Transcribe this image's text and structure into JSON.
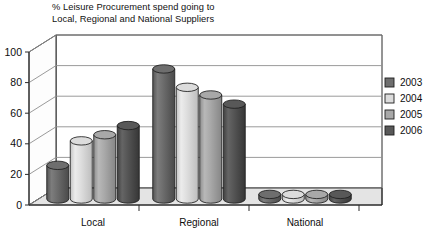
{
  "chart_data": {
    "type": "bar",
    "title": "% Leisure Procurement spend going to\nLocal, Regional and National Suppliers",
    "xlabel": "",
    "ylabel": "",
    "ylim": [
      0,
      100
    ],
    "yticks": [
      0,
      20,
      40,
      60,
      80,
      100
    ],
    "grid": true,
    "legend_position": "right",
    "style": "3d-cylinder",
    "categories": [
      "Local",
      "Regional",
      "National"
    ],
    "series": [
      {
        "name": "2003",
        "color": "#6e6e6e",
        "values": [
          22,
          85,
          3
        ]
      },
      {
        "name": "2004",
        "color": "#dcdcdc",
        "values": [
          38,
          73,
          3
        ]
      },
      {
        "name": "2005",
        "color": "#a8a8a8",
        "values": [
          42,
          68,
          3
        ]
      },
      {
        "name": "2006",
        "color": "#585858",
        "values": [
          48,
          62,
          3
        ]
      }
    ]
  },
  "axis": {
    "tick_labels": [
      "0",
      "20",
      "40",
      "60",
      "80",
      "100"
    ]
  },
  "categories": {
    "labels": [
      "Local",
      "Regional",
      "National"
    ]
  },
  "legend": {
    "entries": [
      {
        "label": "2003"
      },
      {
        "label": "2004"
      },
      {
        "label": "2005"
      },
      {
        "label": "2006"
      }
    ]
  }
}
